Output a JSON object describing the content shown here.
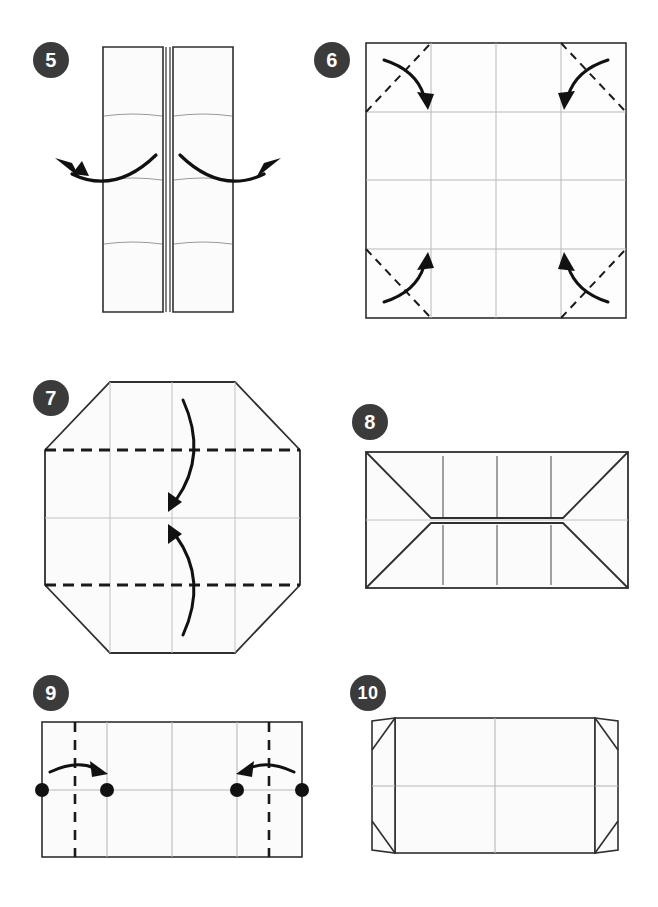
{
  "page": {
    "background": "#ffffff",
    "width": 658,
    "height": 907
  },
  "style": {
    "badge_fill": "#3b3b3b",
    "badge_text": "#ffffff",
    "paper_fill": "#fbfbfb",
    "paper_fill_shade": "#f4f4f4",
    "outline": "#2f2f2f",
    "crease": "#b9b9b9",
    "fold_dash": "#1a1a1a",
    "arrow": "#111111",
    "dot": "#111111"
  },
  "steps": [
    {
      "number": "5",
      "badge_x": 33,
      "badge_y": 42,
      "name": "step-5",
      "caption": "Open the two folded panels outward",
      "figure": {
        "type": "two-panels-open",
        "arrows": [
          "curve-left-out",
          "curve-right-out"
        ],
        "panel_count": 2,
        "crease_lines": 2
      }
    },
    {
      "number": "6",
      "badge_x": 314,
      "badge_y": 42,
      "name": "step-6",
      "caption": "Fold all four corners inward along the diagonals",
      "figure": {
        "type": "square-grid-with-corner-folds",
        "grid_cols": 4,
        "grid_rows": 4,
        "dashed_corners": 4,
        "arrows": 4
      }
    },
    {
      "number": "7",
      "badge_x": 33,
      "badge_y": 380,
      "name": "step-7",
      "caption": "Fold top and bottom edges to the center line",
      "figure": {
        "type": "octagon-with-horizontal-folds",
        "dashed_lines": 2,
        "arrows": 2
      }
    },
    {
      "number": "8",
      "badge_x": 352,
      "badge_y": 404,
      "name": "step-8",
      "caption": "Result after folding top and bottom",
      "figure": {
        "type": "rectangle-with-trapezoid-flaps",
        "flaps": 2,
        "crease_marks": 6
      }
    },
    {
      "number": "9",
      "badge_x": 33,
      "badge_y": 675,
      "name": "step-9",
      "caption": "Fold left and right edges inward to the marked points",
      "figure": {
        "type": "rectangle-with-vertical-folds",
        "dashed_lines": 2,
        "dots": 4,
        "arrows": 2
      }
    },
    {
      "number": "10",
      "badge_x": 350,
      "badge_y": 675,
      "name": "step-10",
      "caption": "Result with side flaps folded in",
      "figure": {
        "type": "rectangle-with-side-flaps",
        "flaps": 2,
        "corner_triangles": 4
      }
    }
  ]
}
